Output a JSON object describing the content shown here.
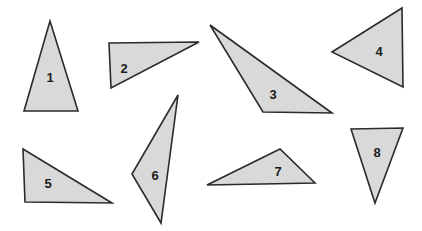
{
  "figure": {
    "background_color": "#ffffff",
    "width": 422,
    "height": 231,
    "style": {
      "fill_color": "#d9d9d9",
      "stroke_color": "#2b2b2b",
      "stroke_width": 1.6,
      "label_color": "#1c1c1c",
      "label_font_size": 13
    }
  },
  "chart_data": {
    "type": "diagram",
    "xlabel": "",
    "ylabel": "",
    "grid": false,
    "legend": "none",
    "shapes": [
      {
        "label": "1",
        "kind": "triangle",
        "points": "50,21 24,111 78,111",
        "label_x": 50,
        "label_y": 77,
        "orientation": "tall isosceles, apex up"
      },
      {
        "label": "2",
        "kind": "triangle",
        "points": "109,43 199,42 111,88",
        "label_x": 124,
        "label_y": 68,
        "orientation": "right triangle, horizontal top edge"
      },
      {
        "label": "3",
        "kind": "triangle",
        "points": "210,25 263,112 332,113",
        "label_x": 273,
        "label_y": 94,
        "orientation": "obtuse, long thin upper edge"
      },
      {
        "label": "4",
        "kind": "triangle",
        "points": "332,52 402,8 403,87",
        "label_x": 379,
        "label_y": 51,
        "orientation": "apex pointing left"
      },
      {
        "label": "5",
        "kind": "triangle",
        "points": "23,149 25,202 112,203",
        "label_x": 48,
        "label_y": 183,
        "orientation": "right triangle, right angle bottom-left"
      },
      {
        "label": "6",
        "kind": "triangle",
        "points": "178,95 132,174 161,223",
        "label_x": 155,
        "label_y": 175,
        "orientation": "narrow slanted, apex up-right"
      },
      {
        "label": "7",
        "kind": "triangle",
        "points": "280,149 207,185 315,183",
        "label_x": 278,
        "label_y": 171,
        "orientation": "flat wide, apex up"
      },
      {
        "label": "8",
        "kind": "triangle",
        "points": "351,129 403,128 375,203",
        "label_x": 377,
        "label_y": 152,
        "orientation": "apex pointing down"
      }
    ]
  }
}
